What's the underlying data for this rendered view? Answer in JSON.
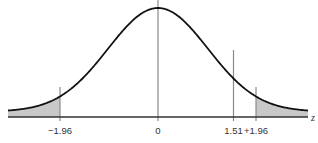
{
  "chart_data": {
    "type": "area",
    "title": "",
    "xlabel": "z",
    "ylabel": "",
    "distribution": "standard normal",
    "xlim": [
      -3.0,
      3.0
    ],
    "ticks": [
      {
        "value": -1.96,
        "label": "−1.96"
      },
      {
        "value": 0,
        "label": "0"
      },
      {
        "value": 1.51,
        "label": "1.51"
      },
      {
        "value": 1.96,
        "label": "+1.96"
      }
    ],
    "shaded_regions": [
      {
        "from": -3.0,
        "to": -1.96,
        "color": "#c8c8c8"
      },
      {
        "from": 1.96,
        "to": 3.0,
        "color": "#c8c8c8"
      }
    ],
    "vertical_lines": [
      {
        "value": -1.96,
        "color": "#8a8a8a"
      },
      {
        "value": 0,
        "color": "#8a8a8a"
      },
      {
        "value": 1.51,
        "color": "#8a8a8a"
      },
      {
        "value": 1.96,
        "color": "#8a8a8a"
      }
    ],
    "grid": false,
    "legend": null
  },
  "colors": {
    "curve": "#111111",
    "axis": "#333333",
    "shade": "#c8c8c8",
    "guide": "#8a8a8a"
  }
}
